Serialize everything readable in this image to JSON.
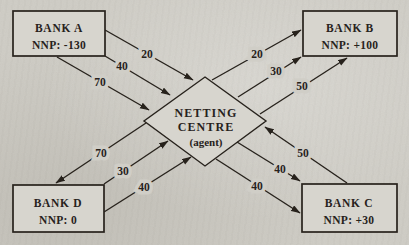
{
  "figure": {
    "kind": "multilateral-netting-diagram",
    "paper_color": "#d0cec7",
    "ink_color": "#27221c"
  },
  "centre": {
    "line1": "NETTING",
    "line2": "CENTRE",
    "subtitle": "(agent)"
  },
  "banks": {
    "a": {
      "name": "BANK A",
      "nnp_label": "NNP: -130",
      "nnp": -130,
      "position": "top-left"
    },
    "b": {
      "name": "BANK B",
      "nnp_label": "NNP: +100",
      "nnp": 100,
      "position": "top-right"
    },
    "c": {
      "name": "BANK C",
      "nnp_label": "NNP: +30",
      "nnp": 30,
      "position": "bottom-right"
    },
    "d": {
      "name": "BANK D",
      "nnp_label": "NNP: 0",
      "nnp": 0,
      "position": "bottom-left"
    }
  },
  "flows": [
    {
      "from": "BANK A",
      "to": "NETTING CENTRE",
      "amount": 20
    },
    {
      "from": "BANK A",
      "to": "NETTING CENTRE",
      "amount": 40
    },
    {
      "from": "BANK A",
      "to": "NETTING CENTRE",
      "amount": 70
    },
    {
      "from": "NETTING CENTRE",
      "to": "BANK B",
      "amount": 20
    },
    {
      "from": "NETTING CENTRE",
      "to": "BANK B",
      "amount": 30
    },
    {
      "from": "NETTING CENTRE",
      "to": "BANK B",
      "amount": 50
    },
    {
      "from": "NETTING CENTRE",
      "to": "BANK D",
      "amount": 70
    },
    {
      "from": "BANK D",
      "to": "NETTING CENTRE",
      "amount": 30
    },
    {
      "from": "BANK D",
      "to": "NETTING CENTRE",
      "amount": 40
    },
    {
      "from": "BANK C",
      "to": "NETTING CENTRE",
      "amount": 50
    },
    {
      "from": "NETTING CENTRE",
      "to": "BANK C",
      "amount": 40
    },
    {
      "from": "NETTING CENTRE",
      "to": "BANK C",
      "amount": 40
    }
  ]
}
